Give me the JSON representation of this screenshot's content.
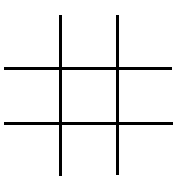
{
  "game": {
    "type": "tic-tac-toe",
    "line_color": "#000000",
    "background": "#ffffff",
    "cells": [
      "",
      "",
      "",
      "",
      "",
      "",
      "",
      "",
      ""
    ]
  }
}
